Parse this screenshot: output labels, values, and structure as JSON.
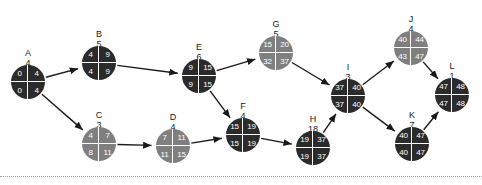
{
  "diagram": {
    "type": "activity-on-node-network",
    "title": "",
    "colors": {
      "critical_node": "#2b2b2b",
      "noncritical_node": "#7f7f7f",
      "node_text": "#ffffff",
      "caption_text": "#1a1a1a",
      "edge": "#1a1a1a",
      "background": "#ffffff",
      "rule": "#9a9aa0"
    },
    "legend": {
      "quadrants": [
        "early-start",
        "early-finish",
        "late-start",
        "late-finish"
      ]
    },
    "nodes": [
      {
        "id": "A",
        "name": "A",
        "duration": "4",
        "es": "0",
        "ef": "4",
        "ls": "0",
        "lf": "4",
        "critical": true,
        "x": 28,
        "y": 82,
        "caption_y": 48
      },
      {
        "id": "B",
        "name": "B",
        "duration": "5",
        "es": "4",
        "ef": "9",
        "ls": "4",
        "lf": "9",
        "critical": true,
        "x": 99,
        "y": 63,
        "caption_y": 29
      },
      {
        "id": "C",
        "name": "C",
        "duration": "3",
        "es": "4",
        "ef": "7",
        "ls": "8",
        "lf": "11",
        "critical": false,
        "x": 99,
        "y": 144,
        "caption_y": 110
      },
      {
        "id": "D",
        "name": "D",
        "duration": "4",
        "es": "7",
        "ef": "11",
        "ls": "11",
        "lf": "15",
        "critical": false,
        "x": 173,
        "y": 146,
        "caption_y": 112
      },
      {
        "id": "E",
        "name": "E",
        "duration": "6",
        "es": "9",
        "ef": "15",
        "ls": "9",
        "lf": "15",
        "critical": true,
        "x": 199,
        "y": 76,
        "caption_y": 42
      },
      {
        "id": "F",
        "name": "F",
        "duration": "4",
        "es": "15",
        "ef": "19",
        "ls": "15",
        "lf": "19",
        "critical": true,
        "x": 243,
        "y": 135,
        "caption_y": 101
      },
      {
        "id": "G",
        "name": "G",
        "duration": "5",
        "es": "15",
        "ef": "20",
        "ls": "32",
        "lf": "37",
        "critical": false,
        "x": 276,
        "y": 53,
        "caption_y": 19
      },
      {
        "id": "H",
        "name": "H",
        "duration": "18",
        "es": "19",
        "ef": "37",
        "ls": "19",
        "lf": "37",
        "critical": true,
        "x": 313,
        "y": 148,
        "caption_y": 114
      },
      {
        "id": "I",
        "name": "I",
        "duration": "3",
        "es": "37",
        "ef": "40",
        "ls": "37",
        "lf": "40",
        "critical": true,
        "x": 348,
        "y": 96,
        "caption_y": 62
      },
      {
        "id": "J",
        "name": "J",
        "duration": "4",
        "es": "40",
        "ef": "44",
        "ls": "43",
        "lf": "47",
        "critical": false,
        "x": 411,
        "y": 48,
        "caption_y": 14
      },
      {
        "id": "K",
        "name": "K",
        "duration": "7",
        "es": "40",
        "ef": "47",
        "ls": "40",
        "lf": "47",
        "critical": true,
        "x": 412,
        "y": 144,
        "caption_y": 110
      },
      {
        "id": "L",
        "name": "L",
        "duration": "1",
        "es": "47",
        "ef": "48",
        "ls": "47",
        "lf": "48",
        "critical": true,
        "x": 452,
        "y": 95,
        "caption_y": 61
      }
    ],
    "edges": [
      {
        "from": "A",
        "to": "B"
      },
      {
        "from": "A",
        "to": "C"
      },
      {
        "from": "B",
        "to": "E"
      },
      {
        "from": "C",
        "to": "D"
      },
      {
        "from": "D",
        "to": "F"
      },
      {
        "from": "E",
        "to": "F"
      },
      {
        "from": "E",
        "to": "G"
      },
      {
        "from": "G",
        "to": "I"
      },
      {
        "from": "F",
        "to": "H"
      },
      {
        "from": "H",
        "to": "I"
      },
      {
        "from": "I",
        "to": "J"
      },
      {
        "from": "I",
        "to": "K"
      },
      {
        "from": "J",
        "to": "L"
      },
      {
        "from": "K",
        "to": "L"
      }
    ]
  }
}
